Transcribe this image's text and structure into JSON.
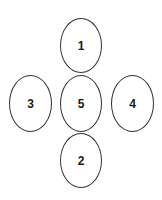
{
  "diagram": {
    "nodes": [
      {
        "id": "1",
        "label": "1",
        "position": "top"
      },
      {
        "id": "2",
        "label": "2",
        "position": "bottom"
      },
      {
        "id": "3",
        "label": "3",
        "position": "left"
      },
      {
        "id": "4",
        "label": "4",
        "position": "right"
      },
      {
        "id": "5",
        "label": "5",
        "position": "center"
      }
    ],
    "colors": {
      "stroke": "#333333",
      "text": "#1a1a1a",
      "background": "#ffffff"
    }
  }
}
